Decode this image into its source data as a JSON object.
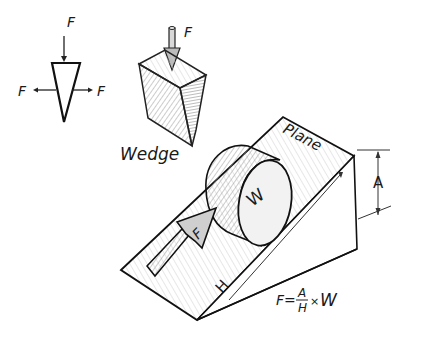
{
  "diagram": {
    "simple_wedge": {
      "top_force_label": "F",
      "left_force_label": "F",
      "right_force_label": "F"
    },
    "wedge_3d": {
      "force_label": "F",
      "caption": "Wedge"
    },
    "inclined_plane": {
      "plane_label": "Plane",
      "height_label": "A",
      "length_label": "H",
      "weight_label": "W",
      "push_force_label": "F"
    },
    "formula": {
      "lhs": "F=",
      "numerator": "A",
      "denominator": "H",
      "times": "×",
      "rhs": "W"
    }
  }
}
